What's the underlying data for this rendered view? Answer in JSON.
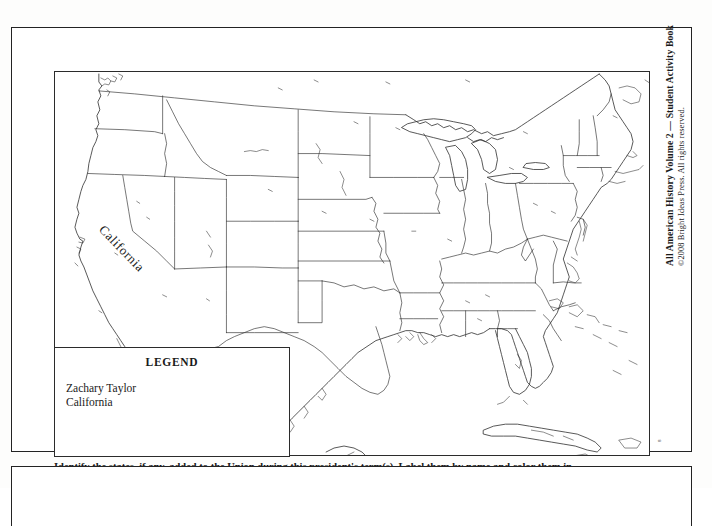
{
  "document": {
    "type": "worksheet",
    "book_title_vertical": "All American History Volume 2 — Student Activity Book",
    "copyright_vertical": "©2008 Bright Ideas Press. All rights reserved.",
    "page_number": "8"
  },
  "map": {
    "title": "United States outline map",
    "state_labels": [
      {
        "name": "California",
        "text": "California"
      }
    ]
  },
  "legend": {
    "title": "LEGEND",
    "entries": [
      {
        "label": "Zachary Taylor"
      },
      {
        "label": "California"
      }
    ]
  },
  "caption": {
    "text": "Identify the states, if any, added to the Union during this president's term(s). Label them by name and color them in."
  },
  "colors": {
    "page_background": "#fdfdfc",
    "frame_stroke": "#232323",
    "map_stroke": "#2e2e2e",
    "text": "#1a1a1a"
  }
}
